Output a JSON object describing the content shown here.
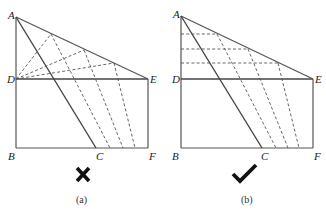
{
  "panels": [
    {
      "id": "a",
      "caption": "(a)",
      "verdict": "incorrect",
      "verdict_icon": "cross-icon",
      "labels": {
        "A": "A",
        "B": "B",
        "C": "C",
        "D": "D",
        "E": "E",
        "F": "F"
      },
      "description": "Dashed construction lines radiate from D to points on AE, then descend parallel to AC to BF"
    },
    {
      "id": "b",
      "caption": "(b)",
      "verdict": "correct",
      "verdict_icon": "check-icon",
      "labels": {
        "A": "A",
        "B": "B",
        "C": "C",
        "D": "D",
        "E": "E",
        "F": "F"
      },
      "description": "Horizontal dashed lines from AD to AE, then descend parallel to AC to BF"
    }
  ]
}
